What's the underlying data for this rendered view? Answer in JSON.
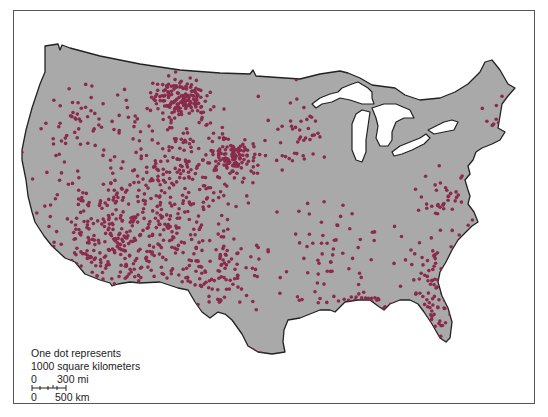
{
  "map": {
    "subject": "Conterminous United States dot density map",
    "land_color": "#a9a9a9",
    "water_color": "#ffffff",
    "outline_color": "#222222",
    "dot_color": "#8b2a4a",
    "dot_density_regions": [
      {
        "name": "north-dakota-prairie-pothole",
        "cx": 180,
        "cy": 98,
        "rx": 26,
        "ry": 18,
        "count": 150
      },
      {
        "name": "nebraska-sandhills",
        "cx": 235,
        "cy": 158,
        "rx": 20,
        "ry": 16,
        "count": 110
      },
      {
        "name": "great-basin-southwest",
        "cx": 120,
        "cy": 235,
        "rx": 80,
        "ry": 55,
        "count": 380
      },
      {
        "name": "rocky-mountains-plains",
        "cx": 175,
        "cy": 170,
        "rx": 60,
        "ry": 60,
        "count": 220
      },
      {
        "name": "pacific-northwest",
        "cx": 85,
        "cy": 120,
        "rx": 55,
        "ry": 40,
        "count": 55
      },
      {
        "name": "west-texas",
        "cx": 215,
        "cy": 270,
        "rx": 45,
        "ry": 35,
        "count": 110
      },
      {
        "name": "upper-midwest",
        "cx": 305,
        "cy": 130,
        "rx": 30,
        "ry": 35,
        "count": 45
      },
      {
        "name": "south-central",
        "cx": 330,
        "cy": 250,
        "rx": 45,
        "ry": 40,
        "count": 55
      },
      {
        "name": "southeast-coast",
        "cx": 440,
        "cy": 270,
        "rx": 35,
        "ry": 50,
        "count": 80
      },
      {
        "name": "florida",
        "cx": 432,
        "cy": 320,
        "rx": 14,
        "ry": 30,
        "count": 45
      },
      {
        "name": "gulf-coast",
        "cx": 370,
        "cy": 300,
        "rx": 50,
        "ry": 10,
        "count": 40
      },
      {
        "name": "mid-atlantic",
        "cx": 445,
        "cy": 195,
        "rx": 30,
        "ry": 25,
        "count": 35
      },
      {
        "name": "new-england",
        "cx": 495,
        "cy": 110,
        "rx": 20,
        "ry": 30,
        "count": 12
      },
      {
        "name": "texas-south-tip",
        "cx": 255,
        "cy": 352,
        "rx": 8,
        "ry": 5,
        "count": 4
      }
    ]
  },
  "legend": {
    "line1": "One dot represents",
    "line2": "1000 square kilometers",
    "scale_mi_zero": "0",
    "scale_mi_value": "300 mi",
    "scale_km_zero": "0",
    "scale_km_value": "500 km"
  }
}
